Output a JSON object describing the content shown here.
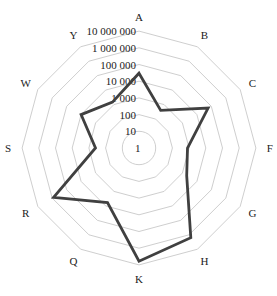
{
  "chart_data": {
    "type": "radar",
    "title": "",
    "scale": "log",
    "categories": [
      "A",
      "B",
      "C",
      "F",
      "G",
      "H",
      "K",
      "Q",
      "R",
      "S",
      "W",
      "Y"
    ],
    "tick_labels": [
      "1",
      "10",
      "100",
      "1 000",
      "10 000",
      "100 000",
      "1 000 000",
      "10 000 000"
    ],
    "tick_values": [
      1,
      10,
      100,
      1000,
      10000,
      100000,
      1000000,
      10000000
    ],
    "range": [
      1,
      10000000
    ],
    "grid": true,
    "legend": null,
    "series": [
      {
        "name": "",
        "color": "#404040",
        "values": [
          30000,
          400,
          60000,
          800,
          2000,
          1600000,
          6000000,
          6000,
          800000,
          400,
          10000,
          1500
        ]
      }
    ]
  },
  "colors": {
    "grid": "#c8c8c8",
    "series": "#404040",
    "text": "#222222",
    "background": "#ffffff"
  }
}
